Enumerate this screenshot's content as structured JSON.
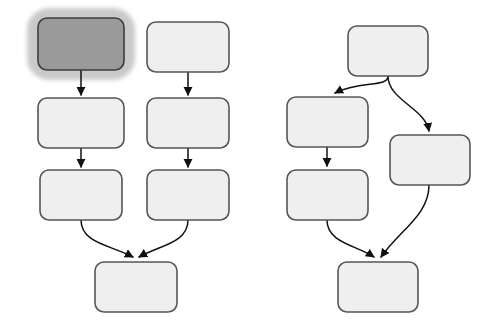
{
  "canvas": {
    "width": 494,
    "height": 334,
    "background": "#ffffff"
  },
  "style": {
    "node_fill": "#efefef",
    "node_stroke": "#555555",
    "node_stroke_width": 1.6,
    "node_corner_radius": 9,
    "selected_node_fill": "#9a9a9a",
    "selected_node_stroke": "#3c3c3c",
    "selection_halo_fill": "#c9c9c9",
    "selection_halo_radius": 22,
    "connector_stroke": "#111111",
    "connector_stroke_width": 1.5,
    "arrowhead_fill": "#111111"
  },
  "diagrams": [
    {
      "name": "left-flowchart",
      "nodes": [
        {
          "id": "L-A1",
          "label": "",
          "x": 38,
          "y": 18,
          "w": 86,
          "h": 52,
          "selected": true
        },
        {
          "id": "L-B1",
          "label": "",
          "x": 147,
          "y": 22,
          "w": 82,
          "h": 50,
          "selected": false
        },
        {
          "id": "L-A2",
          "label": "",
          "x": 38,
          "y": 98,
          "w": 86,
          "h": 50,
          "selected": false
        },
        {
          "id": "L-B2",
          "label": "",
          "x": 147,
          "y": 98,
          "w": 82,
          "h": 50,
          "selected": false
        },
        {
          "id": "L-A3",
          "label": "",
          "x": 40,
          "y": 170,
          "w": 82,
          "h": 50,
          "selected": false
        },
        {
          "id": "L-B3",
          "label": "",
          "x": 147,
          "y": 170,
          "w": 82,
          "h": 50,
          "selected": false
        },
        {
          "id": "L-C4",
          "label": "",
          "x": 95,
          "y": 262,
          "w": 82,
          "h": 50,
          "selected": false
        }
      ],
      "edges": [
        {
          "from": "L-A1",
          "to": "L-A2",
          "kind": "straight-down",
          "path": "M 81 70 L 81 95"
        },
        {
          "from": "L-B1",
          "to": "L-B2",
          "kind": "straight-down",
          "path": "M 188 72 L 188 95"
        },
        {
          "from": "L-A2",
          "to": "L-A3",
          "kind": "straight-down",
          "path": "M 81 148 L 81 167"
        },
        {
          "from": "L-B2",
          "to": "L-B3",
          "kind": "straight-down",
          "path": "M 188 148 L 188 167"
        },
        {
          "from": "L-A3",
          "to": "L-C4",
          "kind": "curve-merge-right",
          "path": "M 81 220 C 81 243 110 245 133 257"
        },
        {
          "from": "L-B3",
          "to": "L-C4",
          "kind": "curve-merge-left",
          "path": "M 188 220 C 188 243 160 245 139 257"
        }
      ]
    },
    {
      "name": "right-flowchart",
      "nodes": [
        {
          "id": "R-TOP",
          "label": "",
          "x": 348,
          "y": 26,
          "w": 80,
          "h": 50,
          "selected": false
        },
        {
          "id": "R-L1",
          "label": "",
          "x": 287,
          "y": 97,
          "w": 81,
          "h": 50,
          "selected": false
        },
        {
          "id": "R-R1",
          "label": "",
          "x": 390,
          "y": 135,
          "w": 80,
          "h": 50,
          "selected": false
        },
        {
          "id": "R-L2",
          "label": "",
          "x": 287,
          "y": 170,
          "w": 81,
          "h": 50,
          "selected": false
        },
        {
          "id": "R-BOT",
          "label": "",
          "x": 338,
          "y": 262,
          "w": 80,
          "h": 50,
          "selected": false
        }
      ],
      "edges": [
        {
          "from": "R-TOP",
          "to": "R-L1",
          "kind": "curve-left-down",
          "path": "M 388 76 C 388 88 360 80 335 93"
        },
        {
          "from": "R-TOP",
          "to": "R-R1",
          "kind": "curve-right-down",
          "path": "M 388 76 C 388 100 425 108 429 131"
        },
        {
          "from": "R-L1",
          "to": "R-L2",
          "kind": "straight-down",
          "path": "M 327 147 L 327 166"
        },
        {
          "from": "R-L2",
          "to": "R-BOT",
          "kind": "curve-merge-right",
          "path": "M 327 220 C 327 243 356 245 374 257"
        },
        {
          "from": "R-R1",
          "to": "R-BOT",
          "kind": "curve-merge-left",
          "path": "M 429 185 C 429 215 400 230 381 257"
        }
      ]
    }
  ]
}
